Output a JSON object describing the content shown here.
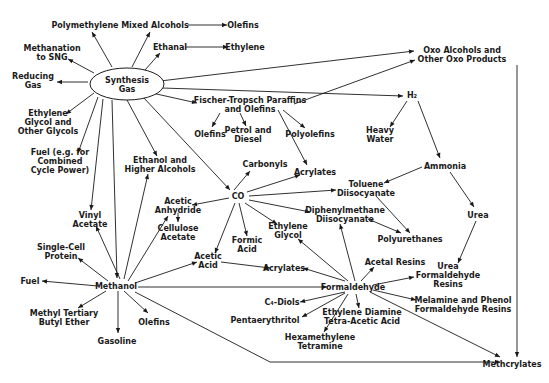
{
  "diagram": {
    "colors": {
      "ink": "#1a1a1a",
      "background": "#ffffff"
    },
    "nodes": [
      {
        "id": "syngas",
        "lines": [
          "Synthesis",
          "Gas"
        ],
        "x": 127,
        "y": 84,
        "shape": "ellipse"
      },
      {
        "id": "polymethylene",
        "lines": [
          "Polymethylene"
        ],
        "x": 85,
        "y": 25
      },
      {
        "id": "mixed_alcohols",
        "lines": [
          "Mixed Alcohols"
        ],
        "x": 155,
        "y": 25
      },
      {
        "id": "olefins_top",
        "lines": [
          "Olefins"
        ],
        "x": 243,
        "y": 25
      },
      {
        "id": "ethanal",
        "lines": [
          "Ethanal"
        ],
        "x": 170,
        "y": 47
      },
      {
        "id": "ethylene",
        "lines": [
          "Ethylene"
        ],
        "x": 245,
        "y": 47
      },
      {
        "id": "methanation",
        "lines": [
          "Methanation",
          "to SNG"
        ],
        "x": 52,
        "y": 52
      },
      {
        "id": "reducing_gas",
        "lines": [
          "Reducing",
          "Gas"
        ],
        "x": 33,
        "y": 80
      },
      {
        "id": "ethylene_glycols",
        "lines": [
          "Ethylene",
          "Glycol and",
          "Other Glycols"
        ],
        "x": 48,
        "y": 122
      },
      {
        "id": "fuel_ccp",
        "lines": [
          "Fuel (e.g. for",
          "Combined",
          "Cycle Power)"
        ],
        "x": 60,
        "y": 161
      },
      {
        "id": "fischer",
        "lines": [
          "Fischer-Tropsch Paraffins",
          "and Olefins"
        ],
        "x": 250,
        "y": 104
      },
      {
        "id": "olefins_ft",
        "lines": [
          "Olefins"
        ],
        "x": 210,
        "y": 134
      },
      {
        "id": "petrol",
        "lines": [
          "Petrol and",
          "Diesel"
        ],
        "x": 248,
        "y": 134
      },
      {
        "id": "polyolefins",
        "lines": [
          "Polyolefins"
        ],
        "x": 310,
        "y": 134
      },
      {
        "id": "oxo",
        "lines": [
          "Oxo Alcohols and",
          "Other Oxo Products"
        ],
        "x": 462,
        "y": 54
      },
      {
        "id": "h2",
        "lines": [
          "H₂"
        ],
        "x": 412,
        "y": 95
      },
      {
        "id": "heavy_water",
        "lines": [
          "Heavy",
          "Water"
        ],
        "x": 380,
        "y": 134
      },
      {
        "id": "ammonia",
        "lines": [
          "Ammonia"
        ],
        "x": 445,
        "y": 166
      },
      {
        "id": "urea",
        "lines": [
          "Urea"
        ],
        "x": 478,
        "y": 215
      },
      {
        "id": "ethanol_higher",
        "lines": [
          "Ethanol and",
          "Higher Alcohols"
        ],
        "x": 160,
        "y": 164
      },
      {
        "id": "carbonyls",
        "lines": [
          "Carbonyls"
        ],
        "x": 265,
        "y": 164
      },
      {
        "id": "acrylates_co",
        "lines": [
          "Acrylates"
        ],
        "x": 315,
        "y": 172
      },
      {
        "id": "co",
        "lines": [
          "CO"
        ],
        "x": 238,
        "y": 196
      },
      {
        "id": "toluene_di",
        "lines": [
          "Toluene",
          "Diisocyanate"
        ],
        "x": 366,
        "y": 188
      },
      {
        "id": "vinyl_acetate",
        "lines": [
          "Vinyl",
          "Acetate"
        ],
        "x": 90,
        "y": 219
      },
      {
        "id": "acetic_anhydride",
        "lines": [
          "Acetic",
          "Anhydride"
        ],
        "x": 178,
        "y": 205
      },
      {
        "id": "cellulose_acetate",
        "lines": [
          "Cellulose",
          "Acetate"
        ],
        "x": 178,
        "y": 232
      },
      {
        "id": "diphenyl_di",
        "lines": [
          "Diphenylmethane",
          "Diisocyanate"
        ],
        "x": 345,
        "y": 214
      },
      {
        "id": "ethylene_glycol",
        "lines": [
          "Ethylene",
          "Glycol"
        ],
        "x": 288,
        "y": 230
      },
      {
        "id": "formic_acid",
        "lines": [
          "Formic",
          "Acid"
        ],
        "x": 247,
        "y": 244
      },
      {
        "id": "polyurethanes",
        "lines": [
          "Polyurethanes"
        ],
        "x": 410,
        "y": 239
      },
      {
        "id": "single_cell",
        "lines": [
          "Single-Cell",
          "Protein"
        ],
        "x": 61,
        "y": 251
      },
      {
        "id": "acetic_acid",
        "lines": [
          "Acetic",
          "Acid"
        ],
        "x": 208,
        "y": 260
      },
      {
        "id": "acrylates_f",
        "lines": [
          "Acrylates"
        ],
        "x": 284,
        "y": 268
      },
      {
        "id": "acetal_resins",
        "lines": [
          "Acetal Resins"
        ],
        "x": 395,
        "y": 262
      },
      {
        "id": "urea_resins",
        "lines": [
          "Urea",
          "Formaldehyde",
          "Resins"
        ],
        "x": 448,
        "y": 275
      },
      {
        "id": "fuel",
        "lines": [
          "Fuel"
        ],
        "x": 30,
        "y": 281
      },
      {
        "id": "methanol",
        "lines": [
          "Methanol"
        ],
        "x": 116,
        "y": 286
      },
      {
        "id": "formaldehyde",
        "lines": [
          "Formaldehyde"
        ],
        "x": 353,
        "y": 287
      },
      {
        "id": "c4_diols",
        "lines": [
          "C₄-Diols"
        ],
        "x": 282,
        "y": 302
      },
      {
        "id": "melamine",
        "lines": [
          "Melamine and Phenol",
          "Formaldehyde Resins"
        ],
        "x": 463,
        "y": 304
      },
      {
        "id": "mtbe",
        "lines": [
          "Methyl Tertiary",
          "Butyl Ether"
        ],
        "x": 64,
        "y": 317
      },
      {
        "id": "olefins_m",
        "lines": [
          "Olefins"
        ],
        "x": 154,
        "y": 322
      },
      {
        "id": "pentaerythritol",
        "lines": [
          "Pentaerythritol"
        ],
        "x": 265,
        "y": 320
      },
      {
        "id": "edta",
        "lines": [
          "Ethylene Diamine",
          "Tetra-Acetic Acid"
        ],
        "x": 362,
        "y": 316
      },
      {
        "id": "hexamethylene",
        "lines": [
          "Hexamethylene",
          "Tetramine"
        ],
        "x": 320,
        "y": 341
      },
      {
        "id": "gasoline",
        "lines": [
          "Gasoline"
        ],
        "x": 117,
        "y": 341
      },
      {
        "id": "methcrylates",
        "lines": [
          "Methcrylates"
        ],
        "x": 512,
        "y": 364
      }
    ],
    "edges": [
      {
        "from": [
          112,
          67
        ],
        "to": [
          92,
          32
        ]
      },
      {
        "from": [
          132,
          67
        ],
        "to": [
          150,
          32
        ]
      },
      {
        "from": [
          188,
          25
        ],
        "to": [
          227,
          25
        ]
      },
      {
        "from": [
          145,
          70
        ],
        "to": [
          160,
          53
        ]
      },
      {
        "from": [
          186,
          47
        ],
        "to": [
          228,
          47
        ]
      },
      {
        "from": [
          94,
          73
        ],
        "to": [
          68,
          59
        ]
      },
      {
        "from": [
          88,
          82
        ],
        "to": [
          57,
          82
        ]
      },
      {
        "from": [
          94,
          93
        ],
        "to": [
          66,
          114
        ]
      },
      {
        "from": [
          98,
          97
        ],
        "to": [
          78,
          153
        ]
      },
      {
        "from": [
          103,
          99
        ],
        "to": [
          91,
          210
        ]
      },
      {
        "from": [
          112,
          100
        ],
        "to": [
          117,
          278
        ]
      },
      {
        "from": [
          127,
          100
        ],
        "to": [
          157,
          156
        ]
      },
      {
        "from": [
          152,
          93
        ],
        "to": [
          197,
          103
        ]
      },
      {
        "from": [
          143,
          97
        ],
        "to": [
          230,
          190
        ]
      },
      {
        "from": [
          160,
          81
        ],
        "to": [
          414,
          51
        ]
      },
      {
        "from": [
          162,
          88
        ],
        "to": [
          403,
          96
        ]
      },
      {
        "from": [
          294,
          104
        ],
        "to": [
          415,
          60
        ]
      },
      {
        "from": [
          220,
          113
        ],
        "to": [
          212,
          127
        ]
      },
      {
        "from": [
          240,
          113
        ],
        "to": [
          246,
          126
        ]
      },
      {
        "from": [
          283,
          110
        ],
        "to": [
          305,
          128
        ]
      },
      {
        "from": [
          278,
          110
        ],
        "to": [
          307,
          165
        ]
      },
      {
        "from": [
          407,
          101
        ],
        "to": [
          390,
          127
        ]
      },
      {
        "from": [
          418,
          101
        ],
        "to": [
          440,
          158
        ]
      },
      {
        "from": [
          517,
          65
        ],
        "to": [
          517,
          357
        ]
      },
      {
        "from": [
          422,
          167
        ],
        "to": [
          384,
          183
        ]
      },
      {
        "from": [
          450,
          172
        ],
        "to": [
          474,
          207
        ]
      },
      {
        "from": [
          476,
          221
        ],
        "to": [
          458,
          263
        ]
      },
      {
        "from": [
          234,
          190
        ],
        "to": [
          250,
          171
        ]
      },
      {
        "from": [
          247,
          192
        ],
        "to": [
          300,
          175
        ]
      },
      {
        "from": [
          249,
          196
        ],
        "to": [
          336,
          190
        ]
      },
      {
        "from": [
          249,
          200
        ],
        "to": [
          310,
          212
        ]
      },
      {
        "from": [
          245,
          203
        ],
        "to": [
          277,
          224
        ]
      },
      {
        "from": [
          239,
          203
        ],
        "to": [
          247,
          236
        ]
      },
      {
        "from": [
          235,
          203
        ],
        "to": [
          215,
          253
        ]
      },
      {
        "from": [
          229,
          198
        ],
        "to": [
          192,
          205
        ]
      },
      {
        "from": [
          178,
          213
        ],
        "to": [
          178,
          222
        ]
      },
      {
        "from": [
          376,
          196
        ],
        "to": [
          410,
          233
        ]
      },
      {
        "from": [
          368,
          219
        ],
        "to": [
          401,
          233
        ]
      },
      {
        "from": [
          120,
          279
        ],
        "to": [
          96,
          226
        ]
      },
      {
        "from": [
          124,
          279
        ],
        "to": [
          148,
          174
        ]
      },
      {
        "from": [
          128,
          281
        ],
        "to": [
          168,
          216
        ]
      },
      {
        "from": [
          108,
          281
        ],
        "to": [
          78,
          258
        ]
      },
      {
        "from": [
          98,
          286
        ],
        "to": [
          42,
          281
        ]
      },
      {
        "from": [
          135,
          283
        ],
        "to": [
          197,
          262
        ]
      },
      {
        "from": [
          221,
          262
        ],
        "to": [
          270,
          268
        ]
      },
      {
        "from": [
          138,
          287
        ],
        "to": [
          327,
          287
        ]
      },
      {
        "from": [
          106,
          291
        ],
        "to": [
          78,
          308
        ]
      },
      {
        "from": [
          118,
          291
        ],
        "to": [
          118,
          333
        ]
      },
      {
        "from": [
          124,
          291
        ],
        "to": [
          148,
          313
        ]
      },
      {
        "from": [
          135,
          292
        ],
        "to": [
          270,
          362
        ],
        "via": [
          [
            270,
            362
          ],
          [
            500,
            362
          ]
        ]
      },
      {
        "from": [
          345,
          281
        ],
        "to": [
          303,
          268
        ]
      },
      {
        "from": [
          348,
          281
        ],
        "to": [
          298,
          239
        ]
      },
      {
        "from": [
          355,
          281
        ],
        "to": [
          340,
          224
        ]
      },
      {
        "from": [
          361,
          281
        ],
        "to": [
          374,
          267
        ]
      },
      {
        "from": [
          373,
          285
        ],
        "to": [
          414,
          277
        ]
      },
      {
        "from": [
          373,
          290
        ],
        "to": [
          416,
          300
        ]
      },
      {
        "from": [
          370,
          292
        ],
        "to": [
          500,
          357
        ]
      },
      {
        "from": [
          345,
          292
        ],
        "to": [
          300,
          302
        ]
      },
      {
        "from": [
          345,
          293
        ],
        "to": [
          302,
          317
        ]
      },
      {
        "from": [
          348,
          294
        ],
        "to": [
          324,
          332
        ]
      },
      {
        "from": [
          356,
          294
        ],
        "to": [
          359,
          308
        ]
      }
    ]
  }
}
